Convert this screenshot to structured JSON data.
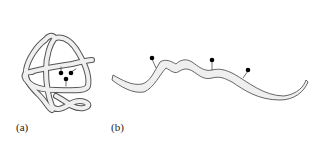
{
  "figure": {
    "panels": [
      {
        "id": "a",
        "label": "(a)",
        "description": "Folded, tangled strand (compact conformation) with three attached dots clustered together",
        "dots": 3
      },
      {
        "id": "b",
        "label": "(b)",
        "description": "Extended, unfolded strand (elongated conformation) with three attached dots spread apart",
        "dots": 3
      }
    ],
    "colors": {
      "strand_fill": "#efefef",
      "strand_outline": "#555555",
      "dot": "#000000",
      "background": "#ffffff"
    }
  }
}
